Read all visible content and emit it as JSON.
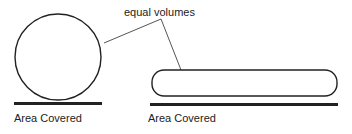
{
  "diagram": {
    "annotation": "equal volumes",
    "left": {
      "shape": "circle",
      "label": "Area Covered"
    },
    "right": {
      "shape": "flattened-rounded-rectangle",
      "label": "Area Covered"
    },
    "colors": {
      "stroke": "#222222",
      "background": "#ffffff",
      "leader_line": "#555555"
    }
  }
}
